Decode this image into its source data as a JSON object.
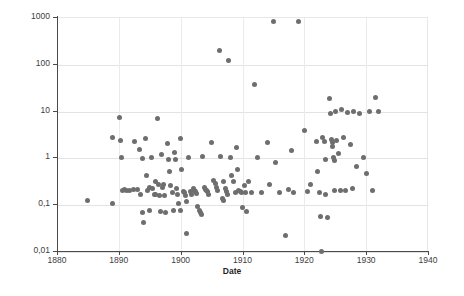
{
  "chart_data": {
    "type": "scatter",
    "title": "",
    "xlabel": "Date",
    "ylabel": "",
    "xlim": [
      1880,
      1940
    ],
    "ylim": [
      0.01,
      1000
    ],
    "yscale": "log",
    "xscale": "linear",
    "grid": true,
    "legend": null,
    "decimal_separator": ",",
    "marker": {
      "shape": "circle",
      "color": "#6e6e6e",
      "size_px": 5
    },
    "x_ticks": [
      {
        "value": 1880,
        "label": "1880"
      },
      {
        "value": 1890,
        "label": "1890"
      },
      {
        "value": 1900,
        "label": "1900"
      },
      {
        "value": 1910,
        "label": "1910"
      },
      {
        "value": 1920,
        "label": "1920"
      },
      {
        "value": 1930,
        "label": "1930"
      },
      {
        "value": 1940,
        "label": "1940"
      }
    ],
    "y_ticks": [
      {
        "value": 1000,
        "label": "1000"
      },
      {
        "value": 100,
        "label": "100"
      },
      {
        "value": 10,
        "label": "10"
      },
      {
        "value": 1,
        "label": "1"
      },
      {
        "value": 0.1,
        "label": "0,1"
      },
      {
        "value": 0.01,
        "label": "0,01"
      }
    ],
    "points": [
      [
        1885.0,
        0.12
      ],
      [
        1888.9,
        2.6
      ],
      [
        1889.0,
        0.105
      ],
      [
        1890.1,
        7.2
      ],
      [
        1890.3,
        2.3
      ],
      [
        1890.4,
        1.0
      ],
      [
        1890.6,
        0.2
      ],
      [
        1890.9,
        0.21
      ],
      [
        1891.2,
        0.2
      ],
      [
        1891.8,
        0.2
      ],
      [
        1892.3,
        0.21
      ],
      [
        1892.6,
        2.2
      ],
      [
        1893.0,
        0.21
      ],
      [
        1893.3,
        1.5
      ],
      [
        1893.5,
        0.16
      ],
      [
        1893.8,
        0.96
      ],
      [
        1893.9,
        0.065
      ],
      [
        1894.0,
        0.04
      ],
      [
        1894.3,
        2.5
      ],
      [
        1894.5,
        0.42
      ],
      [
        1894.7,
        0.2
      ],
      [
        1894.9,
        0.23
      ],
      [
        1895.0,
        0.075
      ],
      [
        1895.3,
        1.0
      ],
      [
        1895.5,
        0.22
      ],
      [
        1895.7,
        0.16
      ],
      [
        1895.9,
        0.3
      ],
      [
        1896.0,
        0.16
      ],
      [
        1896.2,
        6.8
      ],
      [
        1896.4,
        0.26
      ],
      [
        1896.5,
        0.155
      ],
      [
        1896.7,
        0.07
      ],
      [
        1896.9,
        1.15
      ],
      [
        1897.0,
        0.23
      ],
      [
        1897.2,
        0.26
      ],
      [
        1897.4,
        0.155
      ],
      [
        1897.6,
        0.065
      ],
      [
        1897.8,
        2.0
      ],
      [
        1898.0,
        0.9
      ],
      [
        1898.2,
        0.5
      ],
      [
        1898.4,
        0.25
      ],
      [
        1898.6,
        0.175
      ],
      [
        1898.8,
        0.075
      ],
      [
        1899.0,
        1.3
      ],
      [
        1899.2,
        0.9
      ],
      [
        1899.4,
        0.22
      ],
      [
        1899.5,
        0.16
      ],
      [
        1899.7,
        0.105
      ],
      [
        1899.9,
        0.075
      ],
      [
        1900.0,
        2.5
      ],
      [
        1900.2,
        0.55
      ],
      [
        1900.4,
        0.19
      ],
      [
        1900.6,
        0.175
      ],
      [
        1900.8,
        0.155
      ],
      [
        1900.9,
        0.115
      ],
      [
        1901.0,
        0.024
      ],
      [
        1901.3,
        1.0
      ],
      [
        1901.6,
        0.185
      ],
      [
        1901.8,
        0.165
      ],
      [
        1902.0,
        0.22
      ],
      [
        1902.2,
        0.2
      ],
      [
        1902.4,
        0.185
      ],
      [
        1902.6,
        0.17
      ],
      [
        1902.8,
        0.09
      ],
      [
        1903.0,
        0.075
      ],
      [
        1903.2,
        0.065
      ],
      [
        1903.4,
        0.06
      ],
      [
        1903.6,
        1.05
      ],
      [
        1903.8,
        0.23
      ],
      [
        1904.0,
        0.21
      ],
      [
        1904.2,
        0.2
      ],
      [
        1904.4,
        0.19
      ],
      [
        1904.5,
        0.165
      ],
      [
        1905.0,
        2.1
      ],
      [
        1905.3,
        0.32
      ],
      [
        1905.6,
        0.28
      ],
      [
        1905.8,
        0.23
      ],
      [
        1906.0,
        0.2
      ],
      [
        1906.2,
        190.0
      ],
      [
        1906.5,
        1.05
      ],
      [
        1906.7,
        0.13
      ],
      [
        1906.9,
        0.12
      ],
      [
        1907.0,
        0.31
      ],
      [
        1907.2,
        0.22
      ],
      [
        1907.4,
        0.185
      ],
      [
        1907.5,
        0.165
      ],
      [
        1907.8,
        115.0
      ],
      [
        1908.0,
        1.0
      ],
      [
        1908.3,
        0.42
      ],
      [
        1908.6,
        0.3
      ],
      [
        1908.8,
        0.175
      ],
      [
        1909.0,
        1.6
      ],
      [
        1909.2,
        0.55
      ],
      [
        1909.4,
        0.2
      ],
      [
        1909.6,
        0.19
      ],
      [
        1909.8,
        0.175
      ],
      [
        1910.0,
        0.085
      ],
      [
        1910.3,
        0.25
      ],
      [
        1910.5,
        0.175
      ],
      [
        1910.7,
        0.07
      ],
      [
        1911.0,
        0.3
      ],
      [
        1911.5,
        0.175
      ],
      [
        1912.0,
        36.0
      ],
      [
        1912.5,
        1.0
      ],
      [
        1913.0,
        0.18
      ],
      [
        1914.0,
        2.1
      ],
      [
        1914.3,
        0.26
      ],
      [
        1915.0,
        800.0
      ],
      [
        1915.3,
        0.78
      ],
      [
        1916.0,
        0.175
      ],
      [
        1917.0,
        0.021
      ],
      [
        1917.5,
        0.21
      ],
      [
        1918.0,
        1.4
      ],
      [
        1918.3,
        0.18
      ],
      [
        1919.0,
        800.0
      ],
      [
        1920.0,
        3.8
      ],
      [
        1920.5,
        0.19
      ],
      [
        1921.0,
        0.26
      ],
      [
        1922.0,
        2.2
      ],
      [
        1922.2,
        0.5
      ],
      [
        1922.4,
        0.175
      ],
      [
        1922.6,
        0.055
      ],
      [
        1922.8,
        0.01
      ],
      [
        1923.0,
        2.7
      ],
      [
        1923.2,
        2.2
      ],
      [
        1923.4,
        0.9
      ],
      [
        1923.5,
        0.16
      ],
      [
        1923.7,
        0.052
      ],
      [
        1924.0,
        18.0
      ],
      [
        1924.2,
        8.5
      ],
      [
        1924.4,
        2.4
      ],
      [
        1924.5,
        2.1
      ],
      [
        1924.6,
        1.7
      ],
      [
        1924.7,
        1.0
      ],
      [
        1924.8,
        0.85
      ],
      [
        1924.9,
        0.2
      ],
      [
        1925.0,
        9.5
      ],
      [
        1925.2,
        2.3
      ],
      [
        1925.5,
        1.2
      ],
      [
        1925.8,
        0.2
      ],
      [
        1926.0,
        10.5
      ],
      [
        1926.3,
        2.6
      ],
      [
        1926.6,
        0.2
      ],
      [
        1927.0,
        9.0
      ],
      [
        1927.4,
        1.9
      ],
      [
        1927.8,
        0.22
      ],
      [
        1928.0,
        9.8
      ],
      [
        1928.5,
        0.65
      ],
      [
        1929.0,
        8.6
      ],
      [
        1929.5,
        1.0
      ],
      [
        1930.0,
        0.45
      ],
      [
        1930.5,
        9.5
      ],
      [
        1931.0,
        0.2
      ],
      [
        1931.5,
        19.0
      ],
      [
        1932.0,
        9.6
      ]
    ]
  }
}
